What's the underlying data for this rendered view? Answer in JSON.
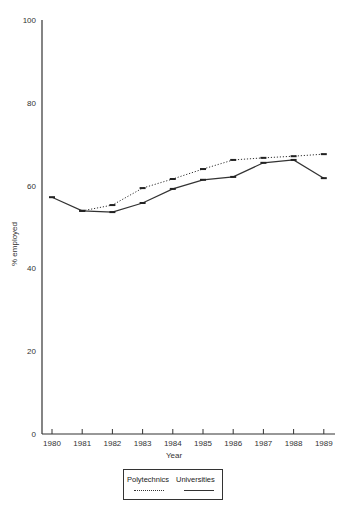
{
  "chart_data": {
    "type": "line",
    "title": "",
    "xlabel": "Year",
    "ylabel": "% employed",
    "ylim": [
      0,
      100
    ],
    "yticks": [
      0,
      20,
      40,
      60,
      80,
      100
    ],
    "grid": false,
    "legend_position": "bottom-center",
    "categories": [
      "1980",
      "1981",
      "1982",
      "1983",
      "1984",
      "1985",
      "1986",
      "1987",
      "1988",
      "1989"
    ],
    "series": [
      {
        "name": "Polytechnics",
        "style": "dotted",
        "values": [
          null,
          53.9,
          55.3,
          59.4,
          61.6,
          64.0,
          66.2,
          66.7,
          67.1,
          67.6
        ]
      },
      {
        "name": "Universities",
        "style": "solid",
        "values": [
          57.2,
          53.9,
          53.6,
          55.8,
          59.2,
          61.4,
          62.1,
          65.5,
          66.2,
          61.8
        ]
      }
    ]
  },
  "legend": {
    "items": [
      {
        "label": "Polytechnics"
      },
      {
        "label": "Universities"
      }
    ]
  }
}
